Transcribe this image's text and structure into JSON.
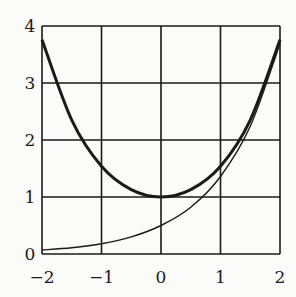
{
  "chart_data": {
    "type": "line",
    "title": "",
    "xlabel": "",
    "ylabel": "",
    "xlim": [
      -2,
      2
    ],
    "ylim": [
      0,
      4
    ],
    "grid": true,
    "legend": null,
    "x_ticks": [
      "−2",
      "−1",
      "0",
      "1",
      "2"
    ],
    "y_ticks": [
      "0",
      "1",
      "2",
      "3",
      "4"
    ],
    "series": [
      {
        "name": "cosh(x)",
        "style": "thick",
        "x": [
          -2,
          -1.5,
          -1,
          -0.5,
          0,
          0.5,
          1,
          1.5,
          2
        ],
        "values": [
          3.76,
          2.35,
          1.54,
          1.13,
          1.0,
          1.13,
          1.54,
          2.35,
          3.76
        ]
      },
      {
        "name": "e^x / 2",
        "style": "thin",
        "x": [
          -2,
          -1.5,
          -1,
          -0.5,
          0,
          0.5,
          1,
          1.5,
          2
        ],
        "values": [
          0.07,
          0.11,
          0.18,
          0.3,
          0.5,
          0.82,
          1.36,
          2.24,
          3.69
        ]
      }
    ]
  },
  "colors": {
    "ink": "#1a1a1a",
    "paper": "#fbfbf9"
  }
}
